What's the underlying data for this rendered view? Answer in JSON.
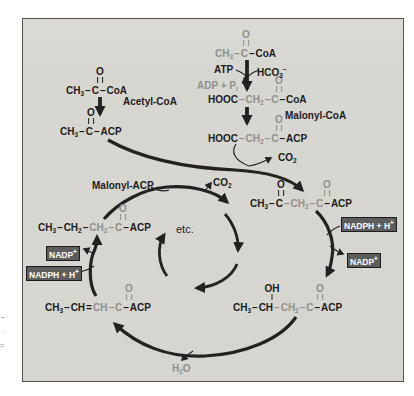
{
  "colors": {
    "bg": "#ffffff",
    "panel": "#d7d5d0",
    "ink": "#1c1c1c",
    "faded": "#8f8f8c",
    "box_bg": "#5d5d5d",
    "box_text": "#ffffff",
    "arrow": "#222222",
    "border": "#55554f"
  },
  "molecules": [
    {
      "id": "acetyl-coa-formula",
      "x": 66,
      "y": 85,
      "bonds": [
        {
          "x": 100,
          "atom": "O",
          "type": "double",
          "color": "ink"
        }
      ],
      "segments": [
        {
          "t": "CH",
          "sub": "3",
          "color": "ink"
        },
        {
          "t": "–",
          "dash": true,
          "color": "ink"
        },
        {
          "t": "C",
          "color": "ink"
        },
        {
          "t": "–",
          "dash": true,
          "color": "ink"
        },
        {
          "t": "CoA",
          "color": "ink"
        }
      ]
    },
    {
      "id": "acetyl-acp-formula",
      "x": 60,
      "y": 126,
      "bonds": [
        {
          "x": 91,
          "atom": "O",
          "type": "double",
          "color": "ink"
        }
      ],
      "segments": [
        {
          "t": "CH",
          "sub": "3",
          "color": "ink"
        },
        {
          "t": "–",
          "dash": true,
          "color": "ink"
        },
        {
          "t": "C",
          "color": "ink"
        },
        {
          "t": "–",
          "dash": true,
          "color": "ink"
        },
        {
          "t": "ACP",
          "color": "ink"
        }
      ]
    },
    {
      "id": "acetyl-coa-right-formula",
      "x": 215,
      "y": 48,
      "bonds": [
        {
          "x": 246,
          "atom": "O",
          "type": "double",
          "color": "faded"
        }
      ],
      "segments": [
        {
          "t": "CH",
          "sub": "3",
          "color": "faded"
        },
        {
          "t": "–",
          "dash": true,
          "color": "faded"
        },
        {
          "t": "C",
          "color": "faded"
        },
        {
          "t": "–",
          "dash": true,
          "color": "ink"
        },
        {
          "t": "CoA",
          "color": "ink"
        }
      ]
    },
    {
      "id": "malonyl-coa-formula",
      "x": 208,
      "y": 94,
      "bonds": [
        {
          "x": 279,
          "atom": "O",
          "type": "double",
          "color": "faded"
        }
      ],
      "segments": [
        {
          "t": "HOOC",
          "color": "ink"
        },
        {
          "t": "–",
          "dash": true,
          "color": "faded"
        },
        {
          "t": "CH",
          "sub": "2",
          "color": "faded"
        },
        {
          "t": "–",
          "dash": true,
          "color": "faded"
        },
        {
          "t": "C",
          "color": "faded"
        },
        {
          "t": "–",
          "dash": true,
          "color": "ink"
        },
        {
          "t": "CoA",
          "color": "ink"
        }
      ]
    },
    {
      "id": "malonyl-acp-formula",
      "x": 208,
      "y": 133,
      "bonds": [
        {
          "x": 279,
          "atom": "O",
          "type": "double",
          "color": "faded"
        }
      ],
      "segments": [
        {
          "t": "HOOC",
          "color": "ink"
        },
        {
          "t": "–",
          "dash": true,
          "color": "faded"
        },
        {
          "t": "CH",
          "sub": "2",
          "color": "faded"
        },
        {
          "t": "–",
          "dash": true,
          "color": "faded"
        },
        {
          "t": "C",
          "color": "faded"
        },
        {
          "t": "–",
          "dash": true,
          "color": "ink"
        },
        {
          "t": "ACP",
          "color": "ink"
        }
      ]
    },
    {
      "id": "acetoacetyl-acp-formula",
      "x": 250,
      "y": 198,
      "bonds": [
        {
          "x": 281,
          "atom": "O",
          "type": "double",
          "color": "ink"
        },
        {
          "x": 327,
          "atom": "O",
          "type": "double",
          "color": "faded"
        }
      ],
      "segments": [
        {
          "t": "CH",
          "sub": "3",
          "color": "ink"
        },
        {
          "t": "–",
          "dash": true,
          "color": "ink"
        },
        {
          "t": "C",
          "color": "ink"
        },
        {
          "t": "–",
          "dash": true,
          "color": "faded"
        },
        {
          "t": "CH",
          "sub": "2",
          "color": "faded"
        },
        {
          "t": "–",
          "dash": true,
          "color": "faded"
        },
        {
          "t": "C",
          "color": "faded"
        },
        {
          "t": "–",
          "dash": true,
          "color": "ink"
        },
        {
          "t": "ACP",
          "color": "ink"
        }
      ]
    },
    {
      "id": "hydroxybutyryl-acp-formula",
      "x": 233,
      "y": 302,
      "bonds": [
        {
          "x": 272,
          "atom": "OH",
          "type": "single",
          "color": "ink"
        },
        {
          "x": 320,
          "atom": "O",
          "type": "double",
          "color": "faded"
        }
      ],
      "segments": [
        {
          "t": "CH",
          "sub": "3",
          "color": "ink"
        },
        {
          "t": "–",
          "dash": true,
          "color": "ink"
        },
        {
          "t": "CH",
          "color": "ink"
        },
        {
          "t": "–",
          "dash": true,
          "color": "faded"
        },
        {
          "t": "CH",
          "sub": "2",
          "color": "faded"
        },
        {
          "t": "–",
          "dash": true,
          "color": "faded"
        },
        {
          "t": "C",
          "color": "faded"
        },
        {
          "t": "–",
          "dash": true,
          "color": "ink"
        },
        {
          "t": "ACP",
          "color": "ink"
        }
      ]
    },
    {
      "id": "crotonyl-acp-formula",
      "x": 45,
      "y": 302,
      "bonds": [
        {
          "x": 129,
          "atom": "O",
          "type": "double",
          "color": "faded"
        }
      ],
      "segments": [
        {
          "t": "CH",
          "sub": "3",
          "color": "ink"
        },
        {
          "t": "–",
          "dash": true,
          "color": "ink"
        },
        {
          "t": "CH",
          "color": "ink"
        },
        {
          "t": "=",
          "dash": true,
          "color": "ink"
        },
        {
          "t": "CH",
          "color": "faded"
        },
        {
          "t": "–",
          "dash": true,
          "color": "faded"
        },
        {
          "t": "C",
          "color": "faded"
        },
        {
          "t": "–",
          "dash": true,
          "color": "ink"
        },
        {
          "t": "ACP",
          "color": "ink"
        }
      ]
    },
    {
      "id": "butyryl-acp-formula",
      "x": 38,
      "y": 222,
      "bonds": [
        {
          "x": 123,
          "atom": "O",
          "type": "double",
          "color": "faded"
        }
      ],
      "segments": [
        {
          "t": "CH",
          "sub": "3",
          "color": "ink"
        },
        {
          "t": "–",
          "dash": true,
          "color": "ink"
        },
        {
          "t": "CH",
          "sub": "2",
          "color": "ink"
        },
        {
          "t": "–",
          "dash": true,
          "color": "ink"
        },
        {
          "t": "CH",
          "sub": "2",
          "color": "faded"
        },
        {
          "t": "–",
          "dash": true,
          "color": "faded"
        },
        {
          "t": "C",
          "color": "faded"
        },
        {
          "t": "–",
          "dash": true,
          "color": "ink"
        },
        {
          "t": "ACP",
          "color": "ink"
        }
      ]
    }
  ],
  "labels": [
    {
      "id": "acetyl-coa-label",
      "x": 123,
      "y": 96,
      "color": "ink",
      "segments": [
        {
          "t": "Acetyl-CoA"
        }
      ]
    },
    {
      "id": "malonyl-coa-label",
      "x": 285,
      "y": 110,
      "color": "ink",
      "segments": [
        {
          "t": "Malonyl-CoA"
        }
      ]
    },
    {
      "id": "malonyl-acp-label",
      "x": 92,
      "y": 180,
      "color": "ink",
      "segments": [
        {
          "t": "Malonyl-ACP"
        }
      ]
    },
    {
      "id": "atp-label",
      "x": 214,
      "y": 64,
      "color": "ink",
      "segments": [
        {
          "t": "ATP"
        }
      ]
    },
    {
      "id": "hco3-label",
      "x": 257,
      "y": 64,
      "color": "ink",
      "segments": [
        {
          "t": "HCO",
          "sub": "3"
        },
        {
          "t": "",
          "sup": "−"
        }
      ]
    },
    {
      "id": "adp-pi-label",
      "x": 197,
      "y": 80,
      "color": "faded",
      "segments": [
        {
          "t": "ADP + P",
          "sub": "i"
        }
      ]
    },
    {
      "id": "co2-condensation-label",
      "x": 278,
      "y": 152,
      "color": "ink",
      "segments": [
        {
          "t": "CO",
          "sub": "2"
        }
      ]
    },
    {
      "id": "co2-cycle-label",
      "x": 213,
      "y": 177,
      "color": "ink",
      "segments": [
        {
          "t": "CO",
          "sub": "2"
        }
      ]
    },
    {
      "id": "etc-label",
      "x": 176,
      "y": 224,
      "color": "ink",
      "weight": "normal",
      "size": 11,
      "segments": [
        {
          "t": "etc."
        }
      ]
    },
    {
      "id": "h2o-label",
      "x": 172,
      "y": 363,
      "color": "faded",
      "segments": [
        {
          "t": "H",
          "sub": "2"
        },
        {
          "t": "O"
        }
      ]
    }
  ],
  "boxes": [
    {
      "id": "nadph-box-right",
      "x": 341,
      "y": 217,
      "segments": [
        {
          "t": "NADPH + H",
          "sup": "+"
        }
      ]
    },
    {
      "id": "nadp-box-right",
      "x": 347,
      "y": 253,
      "segments": [
        {
          "t": "NADP",
          "sup": "+"
        }
      ]
    },
    {
      "id": "nadp-box-left",
      "x": 46,
      "y": 246,
      "segments": [
        {
          "t": "NADP",
          "sup": "+"
        }
      ]
    },
    {
      "id": "nadph-box-left",
      "x": 26,
      "y": 266,
      "segments": [
        {
          "t": "NADPH + H",
          "sup": "+"
        }
      ]
    }
  ],
  "margin_fragments": [
    {
      "t": "–",
      "x": 1,
      "y": 313
    },
    {
      "t": "·",
      "x": 2,
      "y": 328
    },
    {
      "t": "=",
      "x": 0,
      "y": 342
    }
  ]
}
